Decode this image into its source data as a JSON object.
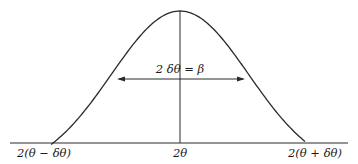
{
  "diagram": {
    "type": "diffraction-peak-profile",
    "colors": {
      "line": "#2a2a2a",
      "text": "#1a1a1a",
      "background": "#ffffff"
    },
    "labels": {
      "left_base": "2(θ − δθ)",
      "center": "2θ",
      "right_base": "2(θ + δθ)",
      "width_annotation": "2 δθ = β"
    },
    "elements": {
      "curve": "bell-shaped intensity peak",
      "baseline": "horizontal axis",
      "center_line": "vertical line from peak to axis",
      "width_arrow": "double-headed arrow at half maximum"
    }
  }
}
